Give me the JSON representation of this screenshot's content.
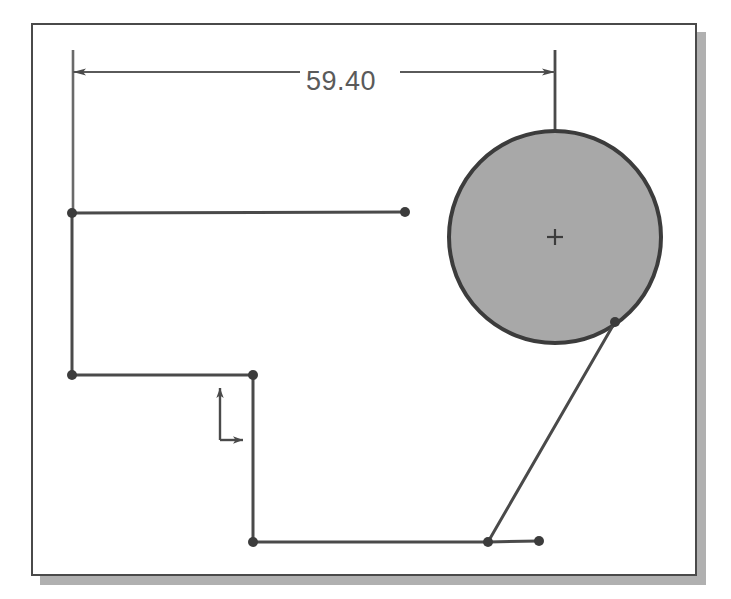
{
  "app": {
    "type": "cad-sketch-viewport",
    "background_color": "#ffffff"
  },
  "drawing_frame": {
    "name": "drawing-border",
    "x": 31,
    "y": 23,
    "width": 666,
    "height": 553,
    "border_color": "#4a4a4a",
    "fill_color": "#ffffff",
    "shadow_color": "#b0b0b0",
    "shadow_offset_x": 9,
    "shadow_offset_y": 9
  },
  "dimension": {
    "label": "59.40",
    "value": 59.4,
    "units": "",
    "text_x": 306,
    "text_y": 66,
    "line_y": 72,
    "line_start_x": 73,
    "line_end_x": 555,
    "text_gap_start": 300,
    "text_gap_end": 400,
    "color": "#5a5a5a",
    "arrow_left": "arrow-left-icon",
    "arrow_right": "arrow-right-icon",
    "extension_left": {
      "x": 73,
      "y_top": 50,
      "y_bottom": 215
    },
    "extension_right": {
      "x": 555,
      "y_top": 50,
      "y_bottom": 238
    }
  },
  "circle": {
    "name": "shaded-circle",
    "center_x": 555,
    "center_y": 237,
    "radius": 106,
    "fill_color": "#a8a8a8",
    "stroke_color": "#3c3c3c",
    "stroke_width": 4,
    "center_mark": "plus-crosshair-icon",
    "center_mark_size": 8
  },
  "geometry": {
    "stroke_color": "#4a4a4a",
    "stroke_width": 3,
    "vertex_color": "#3c3c3c",
    "vertex_radius": 5,
    "polyline_points": "72,213 72,375 253,375 253,542 488,542",
    "top_horizontal": {
      "x1": 72,
      "y1": 213,
      "x2": 405,
      "y2": 212
    },
    "bottom_horizontal": {
      "x1": 488,
      "y1": 542,
      "x2": 539,
      "y2": 541
    },
    "diagonal": {
      "x1": 488,
      "y1": 542,
      "x2": 615,
      "y2": 322
    },
    "vertices": [
      {
        "name": "vertex-top-left",
        "x": 72,
        "y": 213
      },
      {
        "name": "vertex-top-right-end",
        "x": 405,
        "y": 212
      },
      {
        "name": "vertex-mid-left",
        "x": 72,
        "y": 375
      },
      {
        "name": "vertex-step-corner",
        "x": 253,
        "y": 375
      },
      {
        "name": "vertex-bottom-left",
        "x": 253,
        "y": 542
      },
      {
        "name": "vertex-bottom-junction",
        "x": 488,
        "y": 542
      },
      {
        "name": "vertex-bottom-right-end",
        "x": 539,
        "y": 541
      },
      {
        "name": "vertex-on-circle",
        "x": 615,
        "y": 322
      }
    ]
  },
  "origin_marker": {
    "name": "origin-axis-indicator",
    "origin_x": 220,
    "origin_y": 440,
    "y_axis_tip_y": 388,
    "x_axis_tip_x": 243,
    "color": "#4a4a4a",
    "y_arrow": "arrow-up-icon",
    "x_arrow": "arrow-right-icon"
  }
}
